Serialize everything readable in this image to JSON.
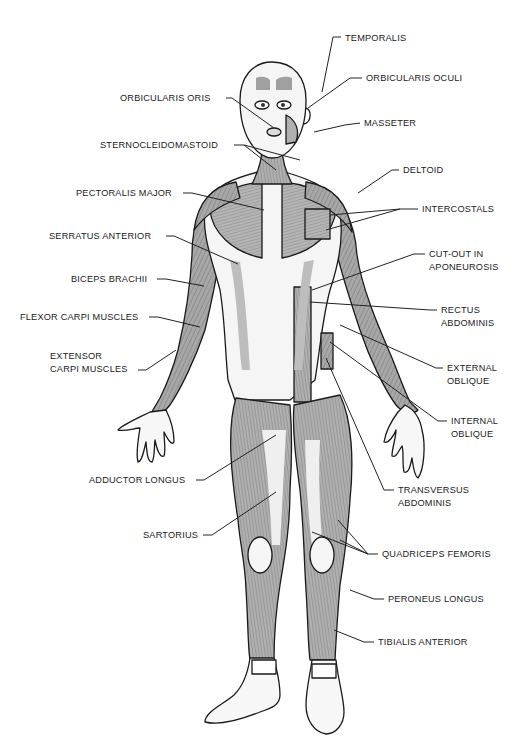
{
  "diagram": {
    "colors": {
      "outline": "#1a1a1a",
      "muscle_shade": "#9a9a9a",
      "muscle_light": "#c9c9c9",
      "skin": "#f4f4f4",
      "leader": "#222222"
    }
  },
  "labels": [
    {
      "id": "temporalis",
      "text": "TEMPORALIS",
      "x": 345,
      "y": 32,
      "align": "left"
    },
    {
      "id": "orbicularis-oculi",
      "text": "ORBICULARIS OCULI",
      "x": 366,
      "y": 72,
      "align": "left"
    },
    {
      "id": "orbicularis-oris",
      "text": "ORBICULARIS ORIS",
      "x": 120,
      "y": 92,
      "align": "left"
    },
    {
      "id": "masseter",
      "text": "MASSETER",
      "x": 364,
      "y": 117,
      "align": "left"
    },
    {
      "id": "sternocleidomastoid",
      "text": "STERNOCLEIDOMASTOID",
      "x": 100,
      "y": 139,
      "align": "left"
    },
    {
      "id": "deltoid",
      "text": "DELTOID",
      "x": 403,
      "y": 164,
      "align": "left"
    },
    {
      "id": "pectoralis-major",
      "text": "PECTORALIS MAJOR",
      "x": 76,
      "y": 187,
      "align": "left"
    },
    {
      "id": "intercostals",
      "text": "INTERCOSTALS",
      "x": 422,
      "y": 203,
      "align": "left"
    },
    {
      "id": "serratus-anterior",
      "text": "SERRATUS ANTERIOR",
      "x": 49,
      "y": 230,
      "align": "left"
    },
    {
      "id": "cut-out-aponeurosis",
      "text": [
        "CUT-OUT IN",
        "APONEUROSIS"
      ],
      "x": 429,
      "y": 248,
      "align": "left"
    },
    {
      "id": "biceps-brachii",
      "text": "BICEPS BRACHII",
      "x": 71,
      "y": 273,
      "align": "left"
    },
    {
      "id": "flexor-carpi",
      "text": "FLEXOR CARPI MUSCLES",
      "x": 20,
      "y": 311,
      "align": "left"
    },
    {
      "id": "rectus-abdominis",
      "text": [
        "RECTUS",
        "ABDOMINIS"
      ],
      "x": 441,
      "y": 304,
      "align": "left"
    },
    {
      "id": "extensor-carpi",
      "text": [
        "EXTENSOR",
        "CARPI MUSCLES"
      ],
      "x": 50,
      "y": 350,
      "align": "left"
    },
    {
      "id": "external-oblique",
      "text": [
        "EXTERNAL",
        "OBLIQUE"
      ],
      "x": 447,
      "y": 362,
      "align": "left"
    },
    {
      "id": "internal-oblique",
      "text": [
        "INTERNAL",
        "OBLIQUE"
      ],
      "x": 451,
      "y": 415,
      "align": "left"
    },
    {
      "id": "adductor-longus",
      "text": "ADDUCTOR LONGUS",
      "x": 89,
      "y": 474,
      "align": "left"
    },
    {
      "id": "transversus-abdominis",
      "text": [
        "TRANSVERSUS",
        "ABDOMINIS"
      ],
      "x": 398,
      "y": 484,
      "align": "left"
    },
    {
      "id": "sartorius",
      "text": "SARTORIUS",
      "x": 143,
      "y": 529,
      "align": "left"
    },
    {
      "id": "quadriceps-femoris",
      "text": "QUADRICEPS FEMORIS",
      "x": 382,
      "y": 548,
      "align": "left"
    },
    {
      "id": "peroneus-longus",
      "text": "PERONEUS LONGUS",
      "x": 388,
      "y": 593,
      "align": "left"
    },
    {
      "id": "tibialis-anterior",
      "text": "TIBIALIS ANTERIOR",
      "x": 378,
      "y": 636,
      "align": "left"
    }
  ]
}
